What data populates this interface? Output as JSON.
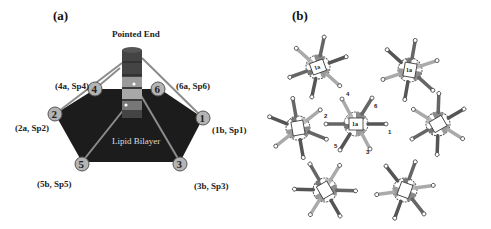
{
  "panel_a": {
    "label": "(a)",
    "title": "Pointed End",
    "center_label": "Lipid Bilayer",
    "nodes": [
      {
        "id": "1",
        "label": "(1b, Sp1)"
      },
      {
        "id": "2",
        "label": "(2a, Sp2)"
      },
      {
        "id": "3",
        "label": "(3b, Sp3)"
      },
      {
        "id": "4",
        "label": "(4a, Sp4)"
      },
      {
        "id": "5",
        "label": "(5b, Sp5)"
      },
      {
        "id": "6",
        "label": "(6a, Sp6)"
      }
    ],
    "colors": {
      "bilayer": "#1c1c1c",
      "node_fill": "#b4b4b4",
      "filament_dark": "#444444",
      "filament_light": "#a8a8a8",
      "tether": "#8c8c8c"
    }
  },
  "panel_b": {
    "label": "(b)",
    "center_unit": {
      "label": "1a",
      "arm_labels": [
        "1",
        "2",
        "3",
        "4",
        "5",
        "6"
      ]
    },
    "surrounding_units": [
      "1a",
      "1a",
      "1a",
      "1a",
      "1a",
      "1a"
    ]
  }
}
